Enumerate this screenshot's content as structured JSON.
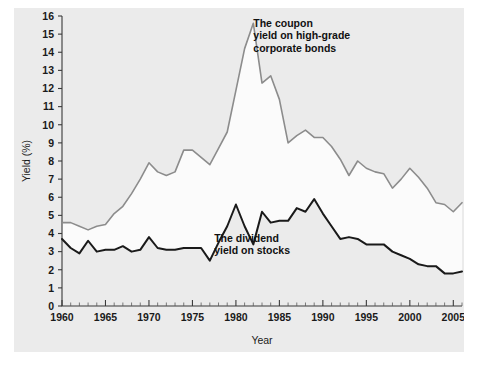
{
  "chart_data": {
    "type": "line",
    "title": "",
    "xlabel": "Year",
    "ylabel": "Yield (%)",
    "xlim": [
      1960,
      2006
    ],
    "ylim": [
      0,
      16
    ],
    "xticks": [
      1960,
      1965,
      1970,
      1975,
      1980,
      1985,
      1990,
      1995,
      2000,
      2005
    ],
    "xtick_labels": [
      "1960",
      "1965",
      "1970",
      "1975",
      "1980",
      "1985",
      "1990",
      "1995",
      "2000",
      "2005"
    ],
    "yticks": [
      0,
      1,
      2,
      3,
      4,
      5,
      6,
      7,
      8,
      9,
      10,
      11,
      12,
      13,
      14,
      15,
      16
    ],
    "ytick_labels": [
      "0",
      "1",
      "2",
      "3",
      "4",
      "5",
      "6",
      "7",
      "8",
      "9",
      "10",
      "11",
      "12",
      "13",
      "14",
      "15",
      "16"
    ],
    "minor_xtick_interval": 1,
    "grid": false,
    "legend": "annotations-inline",
    "x": [
      1960,
      1961,
      1962,
      1963,
      1964,
      1965,
      1966,
      1967,
      1968,
      1969,
      1970,
      1971,
      1972,
      1973,
      1974,
      1975,
      1976,
      1977,
      1978,
      1979,
      1980,
      1981,
      1982,
      1983,
      1984,
      1985,
      1986,
      1987,
      1988,
      1989,
      1990,
      1991,
      1992,
      1993,
      1994,
      1995,
      1996,
      1997,
      1998,
      1999,
      2000,
      2001,
      2002,
      2003,
      2004,
      2005,
      2006
    ],
    "series": [
      {
        "name": "The coupon yield on high-grade corporate bonds",
        "color": "#8c8c8c",
        "linewidth": 1.6,
        "values": [
          4.6,
          4.6,
          4.4,
          4.2,
          4.4,
          4.5,
          5.1,
          5.5,
          6.2,
          7.0,
          7.9,
          7.4,
          7.2,
          7.4,
          8.6,
          8.6,
          8.2,
          7.8,
          8.7,
          9.6,
          11.9,
          14.2,
          15.6,
          12.3,
          12.7,
          11.4,
          9.0,
          9.4,
          9.7,
          9.3,
          9.3,
          8.8,
          8.1,
          7.2,
          8.0,
          7.6,
          7.4,
          7.3,
          6.5,
          7.0,
          7.6,
          7.1,
          6.5,
          5.7,
          5.6,
          5.2,
          5.7
        ]
      },
      {
        "name": "The dividend yield on stocks",
        "color": "#1a1a1a",
        "linewidth": 2.0,
        "values": [
          3.7,
          3.2,
          2.9,
          3.6,
          3.0,
          3.1,
          3.1,
          3.3,
          3.0,
          3.1,
          3.8,
          3.2,
          3.1,
          3.1,
          3.2,
          3.2,
          3.2,
          2.5,
          3.5,
          4.4,
          5.6,
          4.4,
          3.4,
          5.2,
          4.6,
          4.7,
          4.7,
          5.4,
          5.2,
          5.9,
          5.1,
          4.4,
          3.7,
          3.8,
          3.7,
          3.4,
          3.4,
          3.4,
          3.0,
          2.8,
          2.6,
          2.3,
          2.2,
          2.2,
          1.8,
          1.8,
          1.9
        ]
      }
    ],
    "annotations": [
      {
        "name": "bond-annotation",
        "lines": [
          "The coupon",
          "yield on high-grade",
          "corporate bonds"
        ],
        "x": 1982.0,
        "y": 15.4
      },
      {
        "name": "dividend-annotation",
        "lines": [
          "The dividend",
          "yield on stocks"
        ],
        "x": 1977.5,
        "y": 3.55
      }
    ]
  },
  "colors": {
    "figure_background": "#ebebeb",
    "page_background": "#ffffff",
    "band_fill": "#fbfbfb",
    "axis": "#3a3a3a",
    "text": "#1a1a1a"
  }
}
